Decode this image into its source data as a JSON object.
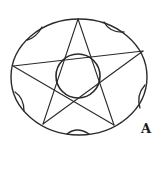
{
  "figure": {
    "label": "A",
    "stroke_color": "#2a2a2a",
    "background": "#ffffff",
    "shapes": {
      "outer_ellipse": {
        "cx": 79,
        "cy": 77,
        "rx": 68,
        "ry": 58
      },
      "pentagram_points": [
        [
          78,
          19
        ],
        [
          143,
          51
        ],
        [
          114,
          125
        ],
        [
          43,
          124
        ],
        [
          13,
          66
        ]
      ],
      "inner_circle": {
        "cx": 78,
        "cy": 77,
        "r": 22
      },
      "edge_notches": 5
    }
  }
}
